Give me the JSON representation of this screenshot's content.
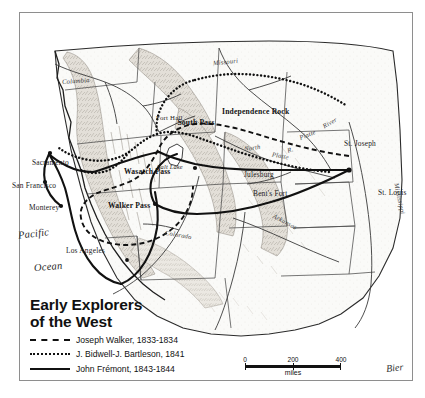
{
  "figure": {
    "kind": "historical-map",
    "signature": "Bier"
  },
  "legend": {
    "title_line1": "Early Explorers",
    "title_line2": "of the West",
    "entries": [
      {
        "style": "dashed",
        "label": "Joseph Walker, 1833-1834"
      },
      {
        "style": "dotted",
        "label": "J. Bidwell-J. Bartleson, 1841"
      },
      {
        "style": "solid",
        "label": "John Frémont, 1843-1844"
      }
    ]
  },
  "scale": {
    "ticks": [
      "0",
      "200",
      "400"
    ],
    "unit": "miles"
  },
  "map": {
    "ocean_label_line1": "Pacific",
    "ocean_label_line2": "Ocean",
    "cities": [
      {
        "name": "Sacramento"
      },
      {
        "name": "San Francisco"
      },
      {
        "name": "Monterey"
      },
      {
        "name": "Los Angeles"
      },
      {
        "name": "St. Joseph"
      },
      {
        "name": "St. Louis"
      },
      {
        "name": "Julesburg"
      },
      {
        "name": "Bent's Fort"
      },
      {
        "name": "Fort Hall"
      }
    ],
    "landmarks": [
      {
        "name": "South Pass"
      },
      {
        "name": "Independence Rock"
      },
      {
        "name": "Wasatch Pass"
      },
      {
        "name": "Walker Pass"
      },
      {
        "name": "Salt Lake"
      }
    ],
    "rivers": [
      {
        "name": "Columbia"
      },
      {
        "name": "Missouri"
      },
      {
        "name": "North"
      },
      {
        "name": "Platte"
      },
      {
        "name": "Platte"
      },
      {
        "name": "River"
      },
      {
        "name": "Arkansas"
      },
      {
        "name": "Colorado"
      },
      {
        "name": "Mississippi"
      },
      {
        "name": "R."
      }
    ]
  },
  "colors": {
    "ink": "#111111",
    "frame": "#8e8e8e",
    "terrain": "#d8d4cd",
    "water": "#ffffff",
    "paper": "#ffffff"
  }
}
